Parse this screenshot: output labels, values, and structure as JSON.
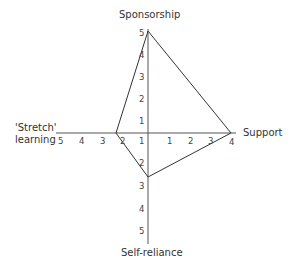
{
  "diagram": {
    "axes": {
      "top": "Sponsorship",
      "right": "Support",
      "bottom": "Self-reliance",
      "left_line1": "'Stretch'",
      "left_line2": "learning"
    },
    "ticks": {
      "top": [
        "1",
        "2",
        "3",
        "4",
        "5"
      ],
      "bottom": [
        "2",
        "3",
        "4",
        "5"
      ],
      "left": [
        "1",
        "2",
        "3",
        "4",
        "5"
      ],
      "right": [
        "1",
        "2",
        "3",
        "4"
      ],
      "center_upper": "1"
    },
    "profile": {
      "Sponsorship": 5,
      "Support": 4,
      "Self-reliance": 2.5,
      "Stretch learning": 2
    },
    "colors": {
      "line": "#333333",
      "axis": "#555555"
    }
  }
}
